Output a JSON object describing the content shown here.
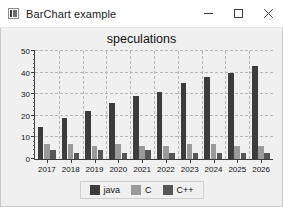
{
  "window": {
    "title": "BarChart example",
    "icon": "barchart-app-icon",
    "controls": [
      {
        "name": "minimize",
        "glyph": "minimize-icon"
      },
      {
        "name": "maximize",
        "glyph": "maximize-icon"
      },
      {
        "name": "close",
        "glyph": "close-icon"
      }
    ]
  },
  "chart_data": {
    "type": "bar",
    "title": "speculations",
    "xlabel": "",
    "ylabel": "",
    "categories": [
      "2017",
      "2018",
      "2019",
      "2020",
      "2021",
      "2022",
      "2023",
      "2024",
      "2025",
      "2026"
    ],
    "series": [
      {
        "name": "java",
        "color": "#3c3c3c",
        "values": [
          15,
          19,
          22,
          26,
          29,
          31,
          35,
          38,
          40,
          43
        ]
      },
      {
        "name": "C",
        "color": "#9a9a9a",
        "values": [
          7,
          7,
          6,
          7,
          6,
          6,
          7,
          7,
          6,
          6
        ]
      },
      {
        "name": "C++",
        "color": "#565656",
        "values": [
          4,
          3,
          4,
          3,
          4,
          3,
          3,
          3,
          3,
          3
        ]
      }
    ],
    "ylim": [
      0,
      50
    ],
    "yticks": [
      0,
      10,
      20,
      30,
      40,
      50
    ],
    "yticklabels": [
      "0",
      "10",
      "20",
      "30",
      "40",
      "50"
    ],
    "grid": true,
    "legend_position": "bottom",
    "legend_entries": [
      "java",
      "C",
      "C++"
    ]
  }
}
